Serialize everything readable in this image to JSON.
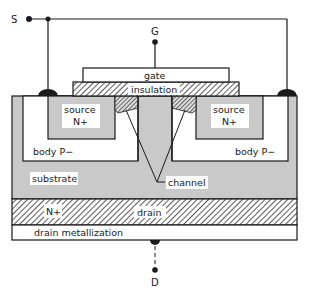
{
  "diagram": {
    "type": "MOSFET cross-section",
    "terminals": {
      "source": "S",
      "gate": "G",
      "drain": "D"
    },
    "labels": {
      "gate": "gate",
      "insulation": "insulation",
      "source_left_1": "source",
      "source_left_2": "N+",
      "source_right_1": "source",
      "source_right_2": "N+",
      "body_left": "body P−",
      "body_right": "body P−",
      "substrate": "substrate",
      "channel": "channel",
      "drain_nplus": "N+",
      "drain": "drain",
      "drain_metallization": "drain metallization"
    },
    "colors": {
      "gray_fill": "#c9c9c9",
      "white_fill": "#ffffff",
      "line": "#1a1a1a"
    }
  }
}
